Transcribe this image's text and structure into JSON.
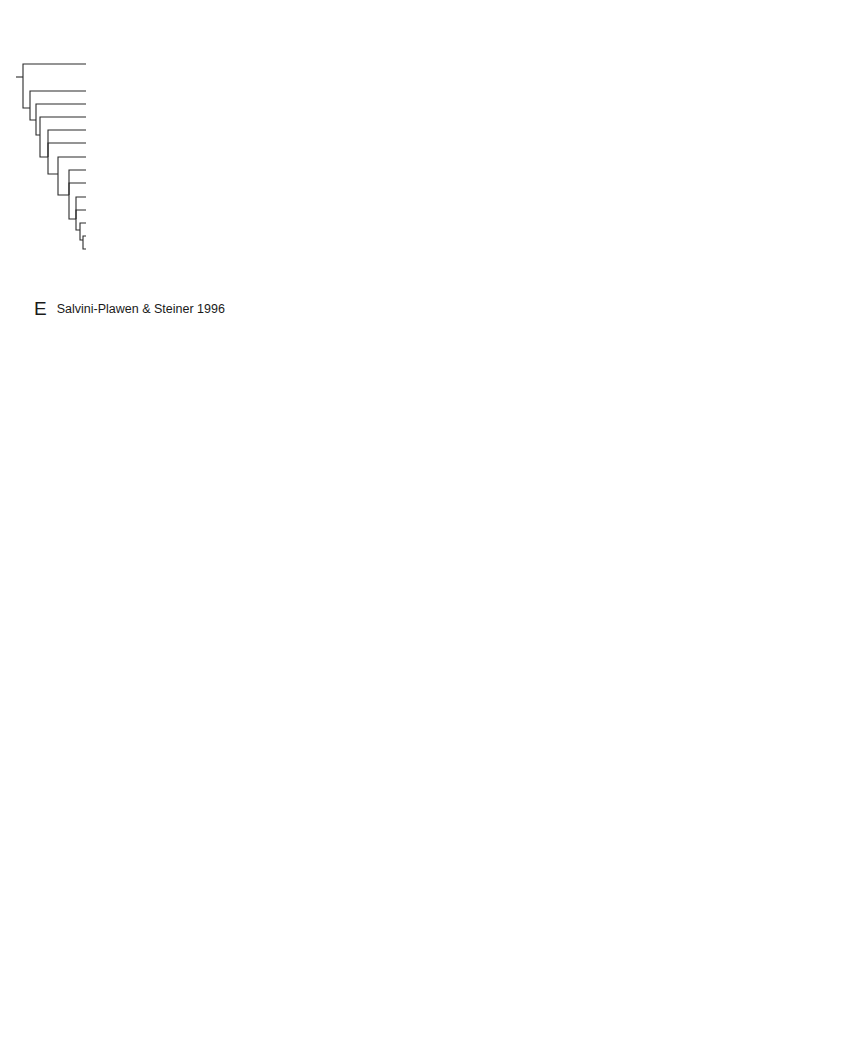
{
  "panels": {
    "E": {
      "letter": "E",
      "citation": "Salvini-Plawen & Steiner 1996",
      "taxa": [
        "Docoglossa",
        "Cocculiniformia",
        "Neritopsina",
        "Vetigastropoda",
        "Melanodrymiidae",
        "Neomphalidae",
        "Architaenioglossa",
        "Caenogastropoda",
        "Campaniloidea",
        "Valvatoidea",
        "Architectonicoidea",
        "Rissoelloidea",
        "Pyramidelloidea",
        "Euthyneura"
      ],
      "groups": [
        {
          "label": "Patellogastropoda",
          "from": 0,
          "to": 0
        },
        {
          "label": "Cocculinoidea & Vetigast.",
          "from": 1,
          "to": 1
        },
        {
          "label": "Neritimorpha",
          "from": 2,
          "to": 2
        },
        {
          "label": "Vetigastropoda",
          "from": 3,
          "to": 5
        },
        {
          "label": "Caenogastropoda",
          "from": 6,
          "to": 8
        },
        {
          "label": "Heterobranchia",
          "from": 9,
          "to": 13
        }
      ]
    },
    "F": {
      "letter": "F",
      "citation": "Ponder & Lindberg 1997",
      "taxa": [
        "Patellina",
        "Neolepetopsidae",
        "Cocculinidae",
        "Neritidae",
        "Phenacolepadidae",
        "Melanodrymia",
        "Neomphalidae",
        "Peltospiridae",
        "Choristellidae",
        "Pseudococculinidae",
        "Seguenziidae",
        "Lepetodrilidae",
        "Scissurellidae",
        "Clypeosectidae",
        "Fissurellidae",
        "Pleurotomariidae",
        "Haliotidae",
        "Trochidae",
        "Valvatoidea",
        "Architectonicoidea",
        "Acteonidae",
        "Aplysiidae",
        "Amphibolidae",
        "Chilinidae",
        "Cyclophoridae",
        "Ampullariidae",
        "Cerithiidea",
        "Campanilidae",
        "Ranellidae",
        "Triphoridae",
        "Littorinidae",
        "Provannidae",
        "Buccinidae",
        "Muricidae",
        "Conoidea"
      ],
      "italic_taxa": [
        "Melanodrymia"
      ],
      "groups": [
        {
          "label": "Patellogastropoda",
          "from": 0,
          "to": 1
        },
        {
          "label": "Cocculinoidea",
          "from": 2,
          "to": 2
        },
        {
          "label": "Neritimorpha",
          "from": 3,
          "to": 4
        },
        {
          "label": "Vetigastropoda",
          "from": 5,
          "to": 17
        },
        {
          "label": "Heterobranchia",
          "from": 18,
          "to": 23
        },
        {
          "label": "Caenogastropoda",
          "from": 24,
          "to": 34
        }
      ]
    },
    "G": {
      "letter": "G",
      "citation_prefix": "Colgan ",
      "citation_italic": "et al",
      "citation_suffix": ". 2003",
      "taxa": [
        "Coccopigya",
        "Cellana",
        "Notoacmaea",
        "Depressigyra",
        "Perotrochus",
        "Montfortula",
        "Austrocochlea",
        "Lepetodrilus",
        "Notocrater",
        "Leptopoma",
        "Bellamya",
        "Cypraea",
        "Aplysia",
        "Bullina",
        "Hedleyoconcha",
        "Ophicardelus",
        "Siphonaria",
        "Salinator",
        "Onchidium",
        "Ataxocerithium",
        "Campanile",
        "Cornirostra",
        "Philippia",
        "Nassarius",
        "Cabestana",
        "Strombus",
        "Cancellaria",
        "Epitonium",
        "Serpulorbis",
        "Eulimidae",
        "Nodilittorina",
        "Zeacumantus",
        "Nerita",
        "Dicathais",
        "Mitra",
        "Conus"
      ],
      "upright_taxa": [
        "Eulimidae"
      ],
      "groups": [
        {
          "label": "Cocculinioidea",
          "from": 0,
          "to": 0
        },
        {
          "label": "Patellogastropoda",
          "from": 1,
          "to": 2
        },
        {
          "label": "Vetigastropoda",
          "from": 3,
          "to": 8
        },
        {
          "label": "Caenogastropoda",
          "from": 9,
          "to": 11
        },
        {
          "label": "Heterobranchia",
          "from": 12,
          "to": 18
        },
        {
          "label": "Caenogastropoda",
          "from": 19,
          "to": 20
        },
        {
          "label": "Heterobranchia",
          "from": 21,
          "to": 22
        },
        {
          "label": "Caenogastropoda",
          "from": 23,
          "to": 31
        },
        {
          "label": "Neritimorpha",
          "from": 32,
          "to": 32
        },
        {
          "label": "Caenogastropoda",
          "from": 33,
          "to": 35
        }
      ]
    },
    "H": {
      "letter": "H",
      "citation": "McArthur & Harasewych 2003",
      "taxa": [
        "Cellana nigrolineata",
        "Acmaea mitra",
        "Nacella magellanica",
        "Temnocinclis euripes",
        "Lepetodrilus fucensis",
        "Cittarium pica",
        "Astraea caelata",
        "Haliotis rufescens",
        "Bathymargarites symplector",
        "Diodora graeca",
        "Mesoplex zelandica",
        "Pyropelta musaica",
        "Caymanabyssia fosteri",
        "Tentaoculus haptricola",
        "Notocrater houbricki",
        "Copylabyssia gradta",
        "Perotrochus quoyanus",
        "Entemnotrochus adansonianus",
        "Mikadotrochus beyrichii",
        "Symmetomphalus regularis",
        "Peltospira operculata",
        "Melanodrymia aurantiaca",
        "Neomphalus fretterae",
        "Cyathermia naticoides",
        "Depressigyra globulus",
        "Cocculina messingi",
        "Coccopigya hispida",
        "Nerita albicilla",
        "Neritina reclivata",
        "Septaria porcellana",
        "Fasciolaria lignaria",
        "Littorina littorea",
        "Helix aspersa",
        "Aplysia punctata"
      ],
      "groups": [
        {
          "label": "Patellogastropoda",
          "from": 0,
          "to": 2
        },
        {
          "label": "Vetigastropoda",
          "from": 3,
          "to": 24
        },
        {
          "label": "Cocculinoidea",
          "from": 25,
          "to": 26
        },
        {
          "label": "Neritimorpha",
          "from": 27,
          "to": 29
        },
        {
          "label": "Caenogastropoda",
          "from": 30,
          "to": 31
        },
        {
          "label": "Heterobranchia",
          "from": 32,
          "to": 33
        }
      ]
    }
  }
}
